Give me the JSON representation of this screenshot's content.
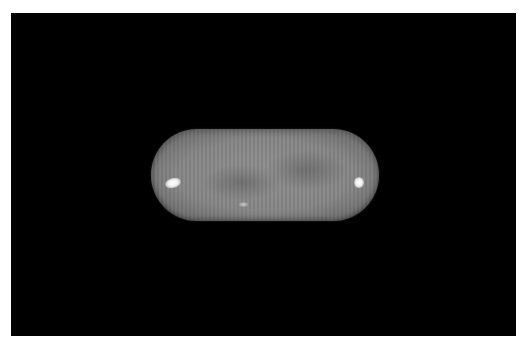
{
  "image": {
    "description": "Grayscale photograph of an oblong capsule-shaped tablet on a black background",
    "background_color": "#000000",
    "border_color": "#ffffff",
    "subject": {
      "type": "capsule-tablet",
      "body_color": "#8a8a8a",
      "texture": "vertical striations with mottled darker patches",
      "highlights": [
        "left-end specular highlight",
        "right-end specular highlight",
        "small center speck"
      ]
    }
  }
}
